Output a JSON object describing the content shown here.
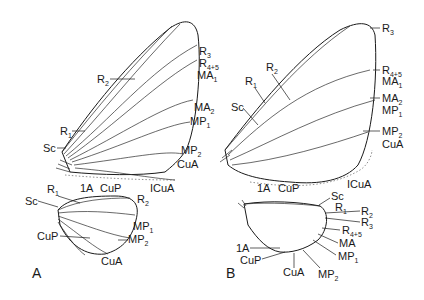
{
  "figure": {
    "panels": [
      {
        "id": "A",
        "label": "A",
        "forewing_labels": [
          "R3",
          "R4+5",
          "MA1",
          "R2",
          "MA2",
          "MP1",
          "R1",
          "Sc",
          "MP2",
          "CuA",
          "1A",
          "CuP",
          "ICuA"
        ],
        "hindwing_labels": [
          "R1",
          "Sc",
          "R2",
          "MP1",
          "MP2",
          "CuP",
          "CuA"
        ]
      },
      {
        "id": "B",
        "label": "B",
        "forewing_labels": [
          "R3",
          "R2",
          "R1",
          "Sc",
          "R4+5",
          "MA1",
          "MA2",
          "MP1",
          "MP2",
          "CuA",
          "1A",
          "CuP",
          "ICuA"
        ],
        "hindwing_labels": [
          "Sc",
          "R1",
          "R2",
          "R3",
          "R4+5",
          "MA",
          "MP1",
          "1A",
          "CuP",
          "CuA",
          "MP2"
        ]
      }
    ]
  },
  "labels": {
    "A": {
      "R3": {
        "base": "R",
        "sub": "3"
      },
      "R45": {
        "base": "R",
        "sub": "4+5"
      },
      "MA1": {
        "base": "MA",
        "sub": "1"
      },
      "R2": {
        "base": "R",
        "sub": "2"
      },
      "MA2": {
        "base": "MA",
        "sub": "2"
      },
      "MP1": {
        "base": "MP",
        "sub": "1"
      },
      "R1": {
        "base": "R",
        "sub": "1"
      },
      "Sc": {
        "base": "Sc",
        "sub": ""
      },
      "MP2": {
        "base": "MP",
        "sub": "2"
      },
      "CuA": {
        "base": "CuA",
        "sub": ""
      },
      "A1": {
        "base": "1A",
        "sub": ""
      },
      "CuP": {
        "base": "CuP",
        "sub": ""
      },
      "ICuA": {
        "base": "ICuA",
        "sub": ""
      },
      "hR1": {
        "base": "R",
        "sub": "1"
      },
      "hSc": {
        "base": "Sc",
        "sub": ""
      },
      "hR2": {
        "base": "R",
        "sub": "2"
      },
      "hMP1": {
        "base": "MP",
        "sub": "1"
      },
      "hMP2": {
        "base": "MP",
        "sub": "2"
      },
      "hCuP": {
        "base": "CuP",
        "sub": ""
      },
      "hCuA": {
        "base": "CuA",
        "sub": ""
      }
    },
    "B": {
      "R3": {
        "base": "R",
        "sub": "3"
      },
      "R2": {
        "base": "R",
        "sub": "2"
      },
      "R1": {
        "base": "R",
        "sub": "1"
      },
      "Sc": {
        "base": "Sc",
        "sub": ""
      },
      "R45": {
        "base": "R",
        "sub": "4+5"
      },
      "MA1": {
        "base": "MA",
        "sub": "1"
      },
      "MA2": {
        "base": "MA",
        "sub": "2"
      },
      "MP1": {
        "base": "MP",
        "sub": "1"
      },
      "MP2": {
        "base": "MP",
        "sub": "2"
      },
      "CuA": {
        "base": "CuA",
        "sub": ""
      },
      "A1": {
        "base": "1A",
        "sub": ""
      },
      "CuP": {
        "base": "CuP",
        "sub": ""
      },
      "ICuA": {
        "base": "ICuA",
        "sub": ""
      },
      "hSc": {
        "base": "Sc",
        "sub": ""
      },
      "hR1": {
        "base": "R",
        "sub": "1"
      },
      "hR2": {
        "base": "R",
        "sub": "2"
      },
      "hR3": {
        "base": "R",
        "sub": "3"
      },
      "hR45": {
        "base": "R",
        "sub": "4+5"
      },
      "hMA": {
        "base": "MA",
        "sub": ""
      },
      "hMP1": {
        "base": "MP",
        "sub": "1"
      },
      "hA1": {
        "base": "1A",
        "sub": ""
      },
      "hCuP": {
        "base": "CuP",
        "sub": ""
      },
      "hCuA": {
        "base": "CuA",
        "sub": ""
      },
      "hMP2": {
        "base": "MP",
        "sub": "2"
      }
    }
  },
  "panel_labels": {
    "A": "A",
    "B": "B"
  }
}
